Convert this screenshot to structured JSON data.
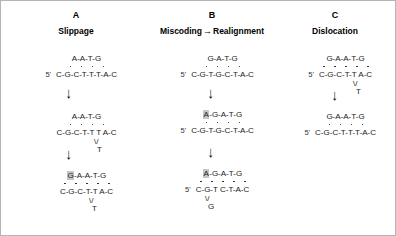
{
  "figure": {
    "background_color": "#ffffff",
    "highlight_color": "#c6c6c6",
    "text_color": "#1a1a1a",
    "five_prime_label": "5'",
    "down_arrow_glyph": "↓",
    "right_arrow_glyph": "→"
  },
  "panels": {
    "a": {
      "letter": "A",
      "title": "Slippage",
      "steps": [
        {
          "top_strand": "A-A-T-G",
          "pair_dots": 4,
          "bottom_strand": "C-G-C-T-T-T-A-C",
          "bottom_five_prime": "5'",
          "bulge_base": ""
        },
        {
          "top_strand": "A-A-T-G",
          "pair_dots": 4,
          "bottom_strand": "C-G-C-T-T T A-C",
          "bottom_five_prime": "",
          "bulge_base": "T"
        },
        {
          "top_strand_highlight": "G",
          "top_strand": "-A-A-T-G",
          "pair_dots": 5,
          "bottom_strand": "C-G-C-T-T A-C",
          "bottom_five_prime": "",
          "bulge_base": "T"
        }
      ]
    },
    "b": {
      "letter": "B",
      "title_left": "Miscoding",
      "title_right": "Realignment",
      "steps": [
        {
          "top_strand": "G-A-T-G",
          "pair_dots": 4,
          "bottom_strand": "C-G-T-G-C-T-A-C",
          "bottom_five_prime": "5'",
          "bulge_base": ""
        },
        {
          "top_strand_highlight": "A",
          "top_strand": "-G-A-T-G",
          "pair_dots": 4,
          "bottom_strand": "C-G-T-G-C-T-A-C",
          "bottom_five_prime": "5'",
          "bulge_base": ""
        },
        {
          "top_strand_highlight": "A",
          "top_strand": "-G-A-T-G",
          "pair_dots": 5,
          "bottom_strand": "C-G-T C-T-A-C",
          "bottom_five_prime": "5'",
          "bulge_base": "G"
        }
      ]
    },
    "c": {
      "letter": "C",
      "title": "Dislocation",
      "steps": [
        {
          "top_strand": "G-A-A-T-G",
          "pair_dots": 5,
          "bottom_strand": "C-G-C-T-T A-C",
          "bottom_five_prime": "5'",
          "bulge_base": "T"
        },
        {
          "top_strand": "G-A-A-T-G",
          "pair_dots": 4,
          "bottom_strand": "C-G-C-T-T-T-A-C",
          "bottom_five_prime": "5'",
          "bulge_base": ""
        }
      ]
    }
  }
}
